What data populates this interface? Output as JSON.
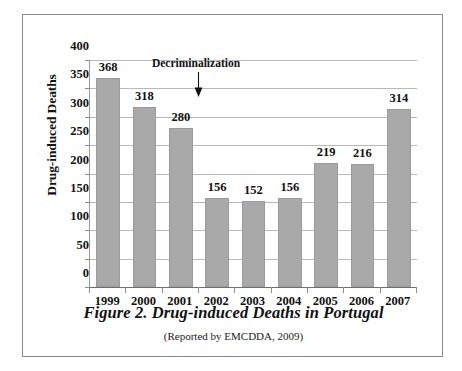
{
  "figure": {
    "caption_title": "Figure 2. Drug-induced Deaths in Portugal",
    "caption_source": "(Reported by EMCDDA, 2009)"
  },
  "chart_data": {
    "type": "bar",
    "title": "Figure 2. Drug-induced Deaths in Portugal",
    "subtitle": "(Reported by EMCDDA, 2009)",
    "xlabel": "",
    "ylabel": "Drug-induced Deaths",
    "categories": [
      "1999",
      "2000",
      "2001",
      "2002",
      "2003",
      "2004",
      "2005",
      "2006",
      "2007"
    ],
    "values": [
      368,
      318,
      280,
      156,
      152,
      156,
      219,
      216,
      314
    ],
    "ylim": [
      0,
      400
    ],
    "yticks": [
      0,
      50,
      100,
      150,
      200,
      250,
      300,
      350,
      400
    ],
    "ytick_labels": [
      "0",
      "50",
      "100",
      "150",
      "200",
      "250",
      "300",
      "350",
      "400"
    ],
    "grid": true,
    "legend": false,
    "bar_color": "#a9a9a9",
    "data_labels": [
      "368",
      "318",
      "280",
      "156",
      "152",
      "156",
      "219",
      "216",
      "314"
    ],
    "annotations": [
      {
        "text": "Decriminalization",
        "points_to_category": "2001",
        "marker": "down-arrow"
      }
    ]
  },
  "colors": {
    "bar": "#a9a9a9",
    "gridline": "#b9b9b9",
    "axis": "#6f6f6f",
    "frame": "#8a8a8a",
    "text": "#111111",
    "background": "#ffffff"
  }
}
